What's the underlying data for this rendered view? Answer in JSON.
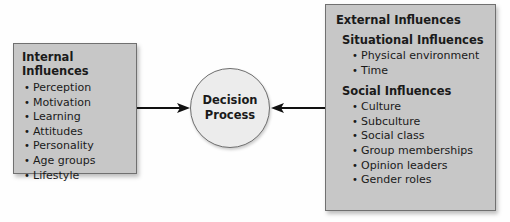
{
  "internal": {
    "title": "Internal Influences",
    "items": [
      "Perception",
      "Motivation",
      "Learning",
      "Attitudes",
      "Personality",
      "Age groups",
      "Lifestyle"
    ]
  },
  "center": {
    "line1": "Decision",
    "line2": "Process"
  },
  "external": {
    "title": "External Influences",
    "situational": {
      "title": "Situational Influences",
      "items": [
        "Physical environment",
        "Time"
      ]
    },
    "social": {
      "title": "Social Influences",
      "items": [
        "Culture",
        "Subculture",
        "Social class",
        "Group memberships",
        "Opinion leaders",
        "Gender roles"
      ]
    }
  }
}
